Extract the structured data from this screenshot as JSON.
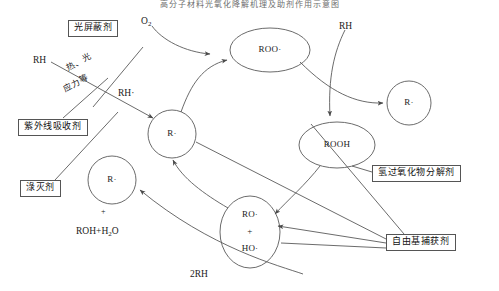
{
  "diagram": {
    "title_strip": "高分子材料光氧化降解机理及助剂作用示意图",
    "nodes": [
      {
        "id": "r-dot-center",
        "label": "R·",
        "shape": "circle",
        "cx": 172,
        "cy": 134,
        "rx": 24,
        "ry": 24
      },
      {
        "id": "roo-dot",
        "label": "ROO·",
        "shape": "ellipse",
        "cx": 270,
        "cy": 50,
        "rx": 40,
        "ry": 22
      },
      {
        "id": "r-dot-right",
        "label": "R·",
        "shape": "circle",
        "cx": 409,
        "cy": 103,
        "rx": 22,
        "ry": 22
      },
      {
        "id": "rooh",
        "label": "ROOH",
        "shape": "ellipse",
        "cx": 337,
        "cy": 145,
        "rx": 38,
        "ry": 23
      },
      {
        "id": "ro-ho",
        "label": "RO· + HO·",
        "shape": "ellipse",
        "cx": 250,
        "cy": 232,
        "rx": 30,
        "ry": 36
      },
      {
        "id": "r-dot-left",
        "label": "R·",
        "shape": "circle",
        "cx": 112,
        "cy": 180,
        "rx": 24,
        "ry": 24
      }
    ],
    "node_labels": {
      "r_dot": "R·",
      "roo_dot": "ROO·",
      "rooh": "ROOH",
      "ro_dot": "RO·",
      "plus": "+",
      "ho_dot": "HO·"
    },
    "reactants": {
      "o2": "O",
      "o2_sub": "2",
      "rh_left": "RH",
      "rh_radical": "RH·",
      "rh_top": "RH",
      "two_rh": "2RH",
      "roh_water": "ROH+H",
      "roh_water_sub": "2",
      "roh_water_tail": "O",
      "plus_standalone": "+"
    },
    "conditions": {
      "line1": "热、光",
      "line2": "应力等"
    },
    "additive_boxes": [
      {
        "id": "light-screener",
        "label": "光屏蔽剂",
        "x": 68,
        "y": 20
      },
      {
        "id": "uv-absorber",
        "label": "紫外线吸收剂",
        "x": 18,
        "y": 119
      },
      {
        "id": "quencher",
        "label": "淥灭剂",
        "x": 20,
        "y": 180
      },
      {
        "id": "hydroperoxide-decomposer",
        "label": "氢过氧化物分解剂",
        "x": 372,
        "y": 165
      },
      {
        "id": "radical-scavenger",
        "label": "自由基捕获剂",
        "x": 386,
        "y": 234
      }
    ],
    "colors": {
      "stroke": "#5a5a5a",
      "text": "#1a1a1a",
      "box_border": "#555555",
      "background": "#ffffff"
    }
  }
}
